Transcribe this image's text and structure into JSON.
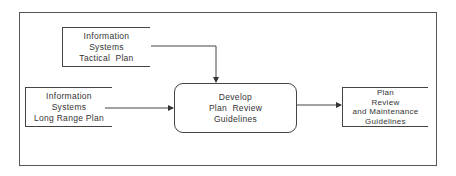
{
  "diagram": {
    "type": "data-flow",
    "nodes": [
      {
        "id": "tactical",
        "shape": "open-box",
        "lines": [
          "Information",
          "Systems",
          "Tactical  Plan"
        ]
      },
      {
        "id": "longrange",
        "shape": "open-box",
        "lines": [
          "Information",
          "Systems",
          "Long Range Plan"
        ]
      },
      {
        "id": "develop",
        "shape": "rounded-rect",
        "lines": [
          "Develop",
          "Plan  Review",
          "Guidelines"
        ]
      },
      {
        "id": "output",
        "shape": "open-box",
        "lines": [
          "Plan",
          "Review",
          "and Maintenance",
          "Guidelines"
        ]
      }
    ],
    "edges": [
      {
        "from": "tactical",
        "to": "develop"
      },
      {
        "from": "longrange",
        "to": "develop"
      },
      {
        "from": "develop",
        "to": "output"
      }
    ],
    "colors": {
      "line": "#444444",
      "background": "#ffffff",
      "text": "#333333"
    }
  }
}
